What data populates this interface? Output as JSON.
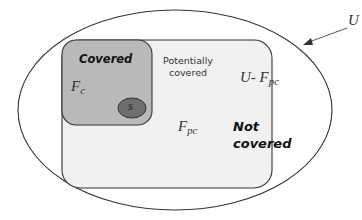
{
  "diagram": {
    "type": "venn-set-diagram",
    "universe": {
      "label": "U",
      "arrow_target": "outer-ellipse"
    },
    "regions": {
      "not_covered": {
        "set_label_prefix": "U- ",
        "set_label_main": "F",
        "set_label_sub": "pc",
        "title_line1": "Not",
        "title_line2": "covered"
      },
      "potentially_covered": {
        "title_line1": "Potentially",
        "title_line2": "covered",
        "set_label_main": "F",
        "set_label_sub": "pc"
      },
      "covered": {
        "title": "Covered",
        "set_label_main": "F",
        "set_label_sub": "c"
      },
      "s": {
        "label": "s"
      }
    },
    "colors": {
      "outline": "#333333",
      "background": "#ffffff",
      "potentially_covered_fill": "#f1f1f1",
      "covered_fill": "#b9b9b9",
      "s_fill": "#6e6e6e",
      "arrow": "#555555"
    }
  }
}
